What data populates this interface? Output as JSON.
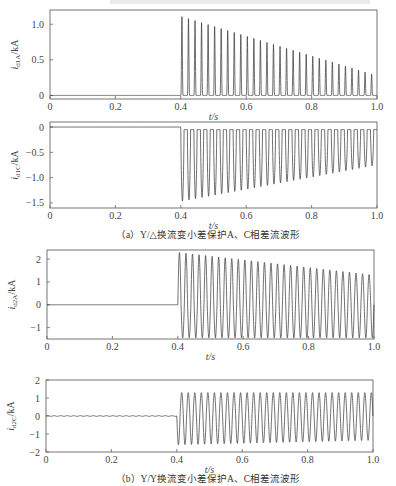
{
  "captions": {
    "a": "（a）Y/△换流变小差保护A、C相差流波形",
    "b": "（b）Y/Y换流变小差保护A、C相差流波形"
  },
  "chart_data": [
    {
      "type": "line",
      "title": "",
      "xlabel": "t/s",
      "ylabel": "i_d1A/kA",
      "ylabel_main": "i",
      "ylabel_sub": "d1A",
      "ylabel_unit": "/kA",
      "xlim": [
        0,
        1.0
      ],
      "ylim": [
        -0.05,
        1.2
      ],
      "xticks": [
        "0",
        "0.2",
        "0.4",
        "0.6",
        "0.8",
        "1.0"
      ],
      "xtick_values": [
        0,
        0.2,
        0.4,
        0.6,
        0.8,
        1.0
      ],
      "yticks": [
        "0",
        "0.5",
        "1.0"
      ],
      "ytick_values": [
        0,
        0.5,
        1.0
      ],
      "fault_time": 0.4,
      "frequency_hz": 50,
      "waveform": "unipolar positive pulses, decaying",
      "peak_start": 1.12,
      "peak_end": 0.28,
      "baseline": 0
    },
    {
      "type": "line",
      "title": "",
      "xlabel": "t/s",
      "ylabel": "i_d1C/kA",
      "ylabel_main": "i",
      "ylabel_sub": "d1C",
      "ylabel_unit": "/kA",
      "xlim": [
        0,
        1.0
      ],
      "ylim": [
        -1.6,
        0.1
      ],
      "xticks": [
        "0",
        "0.2",
        "0.4",
        "0.6",
        "0.8",
        "1.0"
      ],
      "xtick_values": [
        0,
        0.2,
        0.4,
        0.6,
        0.8,
        1.0
      ],
      "yticks": [
        "0",
        "−0.5",
        "−1.0",
        "−1.5"
      ],
      "ytick_values": [
        0,
        -0.5,
        -1.0,
        -1.5
      ],
      "fault_time": 0.4,
      "frequency_hz": 50,
      "waveform": "unipolar negative pulses, decaying",
      "peak_start": -1.47,
      "peak_end": -0.75,
      "baseline": -0.05
    },
    {
      "type": "line",
      "title": "",
      "xlabel": "t/s",
      "ylabel": "i_d2A/kA",
      "ylabel_main": "i",
      "ylabel_sub": "d2A",
      "ylabel_unit": "/kA",
      "xlim": [
        0,
        1.0
      ],
      "ylim": [
        -1.5,
        2.4
      ],
      "xticks": [
        "0",
        "0.2",
        "0.4",
        "0.6",
        "0.8",
        "1.0"
      ],
      "xtick_values": [
        0,
        0.2,
        0.4,
        0.6,
        0.8,
        1.0
      ],
      "yticks": [
        "2",
        "1",
        "0",
        "−1"
      ],
      "ytick_values": [
        2,
        1,
        0,
        -1
      ],
      "fault_time": 0.4,
      "frequency_hz": 50,
      "waveform": "bipolar oscillation, decaying positive peaks",
      "peak_start": 2.3,
      "peak_end": 1.3,
      "trough": -1.45
    },
    {
      "type": "line",
      "title": "",
      "xlabel": "t/s",
      "ylabel": "i_d2C/kA",
      "ylabel_main": "i",
      "ylabel_sub": "d2C",
      "ylabel_unit": "/kA",
      "xlim": [
        0,
        1.0
      ],
      "ylim": [
        -2,
        2
      ],
      "xticks": [
        "0",
        "0.2",
        "0.4",
        "0.6",
        "0.8",
        "1.0"
      ],
      "xtick_values": [
        0,
        0.2,
        0.4,
        0.6,
        0.8,
        1.0
      ],
      "yticks": [
        "2",
        "1",
        "0",
        "−1",
        "−2"
      ],
      "ytick_values": [
        2,
        1,
        0,
        -1,
        -2
      ],
      "fault_time": 0.4,
      "frequency_hz": 50,
      "waveform": "bipolar oscillation, steady amplitude",
      "peak_start": 1.3,
      "peak_end": 1.3,
      "trough_start": -1.6,
      "trough_end": -1.35
    }
  ]
}
